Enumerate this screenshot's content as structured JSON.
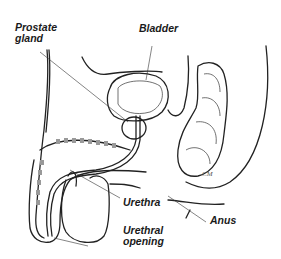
{
  "diagram": {
    "type": "anatomical-illustration",
    "labels": [
      {
        "id": "prostate",
        "text_lines": [
          "Prostate",
          "gland"
        ]
      },
      {
        "id": "bladder",
        "text": "Bladder"
      },
      {
        "id": "urethra",
        "text": "Urethra"
      },
      {
        "id": "anus",
        "text": "Anus"
      },
      {
        "id": "urethral_opening",
        "text_lines": [
          "Urethral",
          "opening"
        ]
      }
    ],
    "signature": "CM",
    "colors": {
      "line": "#222222",
      "background": "#ffffff",
      "text": "#1a1a1a"
    }
  }
}
